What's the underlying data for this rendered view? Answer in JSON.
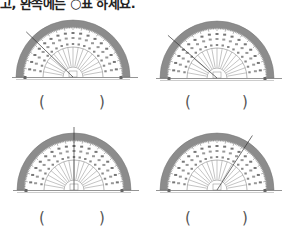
{
  "instruction": "고, 완쪽에는 ○표 하세요.",
  "colors": {
    "band": "#8c8c8c",
    "line": "#333333",
    "ticks": "#666666"
  },
  "problems": [
    {
      "id": 1,
      "answer_open": "(",
      "answer_close": ")",
      "ray_angle_deg": 136
    },
    {
      "id": 2,
      "answer_open": "(",
      "answer_close": ")",
      "ray_angle_deg": 139
    },
    {
      "id": 3,
      "answer_open": "(",
      "answer_close": ")",
      "ray_angle_deg": 90
    },
    {
      "id": 4,
      "answer_open": "(",
      "answer_close": ")",
      "ray_angle_deg": 57
    }
  ]
}
